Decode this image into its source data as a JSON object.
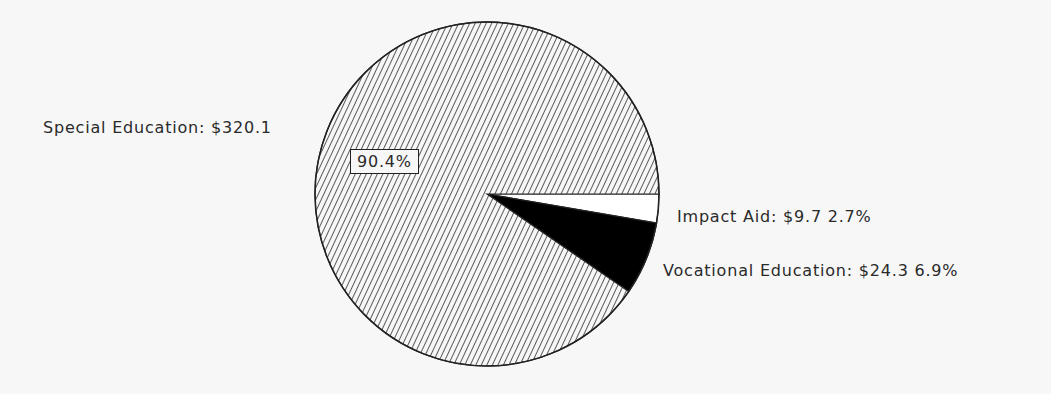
{
  "chart_data": {
    "type": "pie",
    "title": "",
    "slices": [
      {
        "name": "Special Education",
        "value": 320.1,
        "percent": 90.4,
        "fill": "hatch",
        "label": "Special Education: $320.1",
        "pct_label": "90.4%"
      },
      {
        "name": "Impact Aid",
        "value": 9.7,
        "percent": 2.7,
        "fill": "#ffffff",
        "label": "Impact Aid: $9.7  2.7%"
      },
      {
        "name": "Vocational Education",
        "value": 24.3,
        "percent": 6.9,
        "fill": "#000000",
        "label": "Vocational Education: $24.3  6.9%"
      }
    ],
    "start_angle_deg": 0,
    "direction": "clockwise",
    "legend": "none"
  },
  "labels": {
    "special": "Special Education: $320.1",
    "special_pct": "90.4%",
    "impact": "Impact Aid: $9.7  2.7%",
    "vocational": "Vocational Education: $24.3  6.9%"
  }
}
